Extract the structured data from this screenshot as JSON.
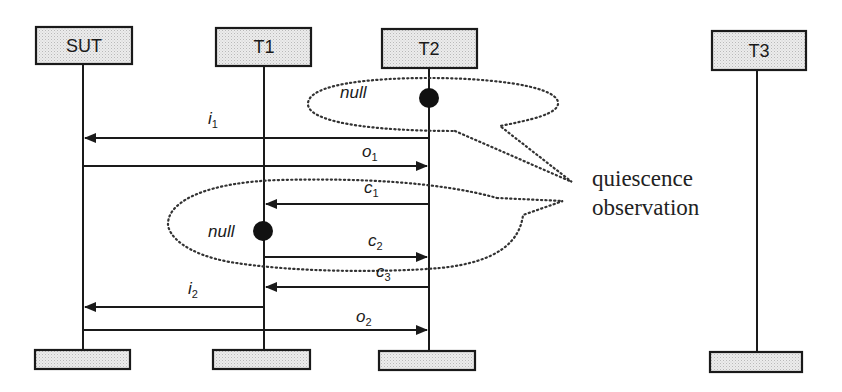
{
  "diagram": {
    "type": "sequence",
    "actors": [
      {
        "id": "sut",
        "label": "SUT",
        "x": 83
      },
      {
        "id": "t1",
        "label": "T1",
        "x": 264
      },
      {
        "id": "t2",
        "label": "T2",
        "x": 429
      },
      {
        "id": "t3",
        "label": "T3",
        "x": 757
      }
    ],
    "messages": [
      {
        "name": "i",
        "sub": "1",
        "from": "T2",
        "to": "SUT"
      },
      {
        "name": "o",
        "sub": "1",
        "from": "SUT",
        "to": "T2"
      },
      {
        "name": "c",
        "sub": "1",
        "from": "T2",
        "to": "T1"
      },
      {
        "name": "c",
        "sub": "2",
        "from": "T1",
        "to": "T2"
      },
      {
        "name": "c",
        "sub": "3",
        "from": "T2",
        "to": "T1"
      },
      {
        "name": "i",
        "sub": "2",
        "from": "T1",
        "to": "SUT"
      },
      {
        "name": "o",
        "sub": "2",
        "from": "SUT",
        "to": "T2"
      }
    ],
    "null_markers": [
      {
        "label": "null",
        "actor": "T2"
      },
      {
        "label": "null",
        "actor": "T1"
      }
    ],
    "note": {
      "line1": "quiescence",
      "line2": "observation"
    },
    "colors": {
      "line": "#1a1a1a",
      "box_fill": "#e6e6e6",
      "dotted": "#333333"
    }
  }
}
